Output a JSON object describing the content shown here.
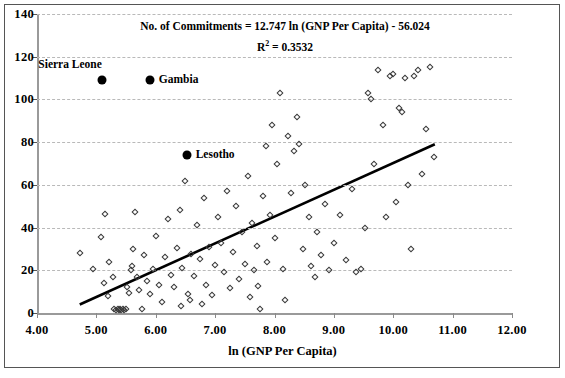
{
  "chart_data": {
    "type": "scatter",
    "title": "",
    "xlabel": "ln (GNP Per Capita)",
    "ylabel": "",
    "xlim": [
      4.0,
      12.0
    ],
    "ylim": [
      0,
      140
    ],
    "xticks": [
      "4.00",
      "5.00",
      "6.00",
      "7.00",
      "8.00",
      "9.00",
      "10.00",
      "11.00",
      "12.00"
    ],
    "xtick_values": [
      4,
      5,
      6,
      7,
      8,
      9,
      10,
      11,
      12
    ],
    "yticks": [
      "0",
      "20",
      "40",
      "60",
      "80",
      "100",
      "120",
      "140"
    ],
    "ytick_values": [
      0,
      20,
      40,
      60,
      80,
      100,
      120,
      140
    ],
    "grid": true,
    "grid_axis": "y",
    "legend": "none",
    "annotations": [
      {
        "text": "No. of Commitments = 12.747 ln (GNP Per Capita) - 56.024",
        "name": "regression-equation"
      },
      {
        "text": "R² = 0.3532",
        "name": "r-squared",
        "base": "R",
        "exponent": "2",
        "value": "= 0.3532"
      }
    ],
    "trendline": {
      "type": "logarithmic",
      "slope_coefficient": 12.747,
      "intercept": -56.024,
      "r_squared": 0.3532,
      "x_start": 4.72,
      "y_start": 4.0,
      "x_end": 10.7,
      "y_end": 79.0,
      "color": "#000000"
    },
    "series": [
      {
        "name": "Countries",
        "marker": "open-diamond",
        "color": "#3a3a3a",
        "points": [
          [
            4.72,
            28.0
          ],
          [
            4.95,
            20.5
          ],
          [
            5.07,
            35.5
          ],
          [
            5.12,
            14.0
          ],
          [
            5.15,
            46.5
          ],
          [
            5.2,
            8.0
          ],
          [
            5.22,
            24.0
          ],
          [
            5.28,
            17.0
          ],
          [
            5.3,
            2.0
          ],
          [
            5.33,
            1.5
          ],
          [
            5.36,
            2.0
          ],
          [
            5.38,
            1.5
          ],
          [
            5.4,
            2.0
          ],
          [
            5.42,
            1.5
          ],
          [
            5.44,
            2.0
          ],
          [
            5.47,
            1.5
          ],
          [
            5.5,
            2.0
          ],
          [
            5.52,
            12.0
          ],
          [
            5.55,
            9.5
          ],
          [
            5.58,
            20.0
          ],
          [
            5.6,
            22.0
          ],
          [
            5.62,
            30.0
          ],
          [
            5.65,
            47.5
          ],
          [
            5.68,
            17.0
          ],
          [
            5.72,
            11.0
          ],
          [
            5.76,
            2.0
          ],
          [
            5.8,
            27.0
          ],
          [
            5.85,
            15.0
          ],
          [
            5.9,
            9.0
          ],
          [
            5.95,
            20.5
          ],
          [
            6.0,
            36.0
          ],
          [
            6.05,
            13.0
          ],
          [
            6.1,
            5.0
          ],
          [
            6.15,
            26.0
          ],
          [
            6.2,
            44.0
          ],
          [
            6.25,
            18.0
          ],
          [
            6.3,
            12.0
          ],
          [
            6.35,
            30.5
          ],
          [
            6.4,
            48.0
          ],
          [
            6.42,
            3.5
          ],
          [
            6.45,
            21.0
          ],
          [
            6.5,
            62.0
          ],
          [
            6.55,
            9.0
          ],
          [
            6.58,
            6.0
          ],
          [
            6.6,
            27.5
          ],
          [
            6.65,
            17.5
          ],
          [
            6.7,
            41.0
          ],
          [
            6.75,
            25.5
          ],
          [
            6.78,
            4.0
          ],
          [
            6.82,
            54.0
          ],
          [
            6.85,
            13.0
          ],
          [
            6.9,
            31.0
          ],
          [
            6.95,
            8.5
          ],
          [
            7.0,
            22.5
          ],
          [
            7.05,
            45.0
          ],
          [
            7.1,
            33.0
          ],
          [
            7.15,
            19.0
          ],
          [
            7.2,
            57.0
          ],
          [
            7.25,
            11.5
          ],
          [
            7.3,
            28.5
          ],
          [
            7.35,
            50.0
          ],
          [
            7.4,
            16.0
          ],
          [
            7.45,
            38.0
          ],
          [
            7.5,
            23.0
          ],
          [
            7.55,
            64.0
          ],
          [
            7.58,
            7.5
          ],
          [
            7.62,
            42.0
          ],
          [
            7.65,
            20.0
          ],
          [
            7.7,
            31.5
          ],
          [
            7.72,
            12.5
          ],
          [
            7.76,
            2.0
          ],
          [
            7.8,
            55.0
          ],
          [
            7.85,
            78.0
          ],
          [
            7.88,
            24.0
          ],
          [
            7.92,
            46.0
          ],
          [
            7.95,
            88.0
          ],
          [
            8.0,
            35.0
          ],
          [
            8.05,
            70.0
          ],
          [
            8.1,
            103.0
          ],
          [
            8.15,
            20.5
          ],
          [
            8.18,
            6.0
          ],
          [
            8.22,
            83.0
          ],
          [
            8.28,
            56.0
          ],
          [
            8.32,
            76.0
          ],
          [
            8.38,
            92.0
          ],
          [
            8.42,
            79.0
          ],
          [
            8.48,
            30.0
          ],
          [
            8.52,
            60.0
          ],
          [
            8.58,
            45.0
          ],
          [
            8.62,
            22.0
          ],
          [
            8.68,
            17.0
          ],
          [
            8.72,
            38.0
          ],
          [
            8.78,
            27.0
          ],
          [
            8.85,
            51.0
          ],
          [
            8.92,
            20.0
          ],
          [
            9.0,
            33.0
          ],
          [
            9.1,
            46.0
          ],
          [
            9.2,
            25.0
          ],
          [
            9.3,
            58.0
          ],
          [
            9.38,
            19.0
          ],
          [
            9.45,
            20.5
          ],
          [
            9.52,
            40.0
          ],
          [
            9.58,
            103.0
          ],
          [
            9.62,
            100.0
          ],
          [
            9.68,
            70.0
          ],
          [
            9.75,
            114.0
          ],
          [
            9.82,
            88.0
          ],
          [
            9.88,
            45.0
          ],
          [
            9.95,
            111.0
          ],
          [
            10.0,
            112.0
          ],
          [
            10.05,
            52.0
          ],
          [
            10.1,
            96.0
          ],
          [
            10.15,
            94.0
          ],
          [
            10.2,
            110.0
          ],
          [
            10.25,
            60.0
          ],
          [
            10.3,
            30.0
          ],
          [
            10.35,
            111.0
          ],
          [
            10.42,
            114.0
          ],
          [
            10.48,
            65.0
          ],
          [
            10.55,
            86.0
          ],
          [
            10.62,
            115.0
          ],
          [
            10.68,
            73.0
          ]
        ]
      },
      {
        "name": "Highlighted Countries",
        "marker": "filled-circle",
        "color": "#000000",
        "points": [
          {
            "label": "Sierra Leone",
            "x": 5.1,
            "y": 109.0,
            "label_position": "above-left"
          },
          {
            "label": "Gambia",
            "x": 5.9,
            "y": 109.0,
            "label_position": "right"
          },
          {
            "label": "Lesotho",
            "x": 6.52,
            "y": 74.0,
            "label_position": "right"
          }
        ]
      }
    ]
  }
}
